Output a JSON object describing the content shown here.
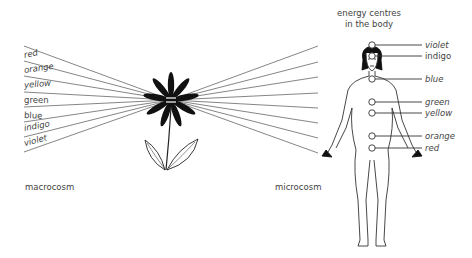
{
  "title": {
    "line1": "energy centres",
    "line2": "in the body"
  },
  "left": {
    "caption": "macrocosm",
    "colors": [
      "red",
      "orange",
      "yellow",
      "green",
      "blue",
      "indigo",
      "violet"
    ]
  },
  "right": {
    "caption": "microcosm",
    "chakras": [
      {
        "label": "violet",
        "y": 45
      },
      {
        "label": "indigo",
        "y": 56
      },
      {
        "label": "blue",
        "y": 79
      },
      {
        "label": "green",
        "y": 102
      },
      {
        "label": "yellow",
        "y": 113
      },
      {
        "label": "orange",
        "y": 136
      },
      {
        "label": "red",
        "y": 148
      }
    ]
  },
  "style": {
    "line_color": "#555555",
    "ink_color": "#111111"
  }
}
